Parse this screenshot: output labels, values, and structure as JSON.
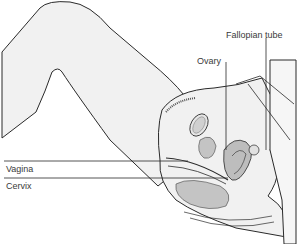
{
  "diagram": {
    "type": "anatomical-cross-section",
    "labels": {
      "fallopian_tube": "Fallopian tube",
      "ovary": "Ovary",
      "vagina": "Vagina",
      "cervix": "Cervix"
    },
    "colors": {
      "background": "#ffffff",
      "skin_fill": "#f1f1f1",
      "organ_fill": "#bdbdbd",
      "line": "#2a2a2a",
      "label_text": "#3a3a3a"
    }
  }
}
